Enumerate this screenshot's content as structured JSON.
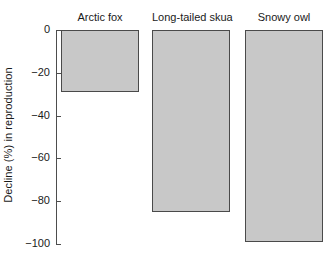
{
  "chart_data": {
    "type": "bar",
    "title": "",
    "subtitle": "",
    "xlabel": "",
    "ylabel": "Decline (%) in reproduction",
    "categories": [
      "Arctic fox",
      "Long-tailed skua",
      "Snowy owl"
    ],
    "values": [
      -29,
      -85,
      -99
    ],
    "series": [
      {
        "name": "Decline in reproduction",
        "values": [
          -29,
          -85,
          -99
        ]
      }
    ],
    "ylim": [
      -100,
      0
    ],
    "ytick_labels": [
      "0",
      "-20",
      "-40",
      "-60",
      "-80",
      "-100"
    ],
    "ytick_values": [
      0,
      -20,
      -40,
      -60,
      -80,
      -100
    ],
    "grid": false,
    "legend": false,
    "legend_position": "none",
    "orientation": "vertical",
    "bars_direction": "downward-from-zero",
    "bar_fill_color": "#c8c8c8",
    "bar_border_color": "#4a4a4a",
    "axis_color": "#4d4d4d",
    "background_color": "#ffffff",
    "category_labels_position": "top",
    "x_axis_visible": false
  }
}
